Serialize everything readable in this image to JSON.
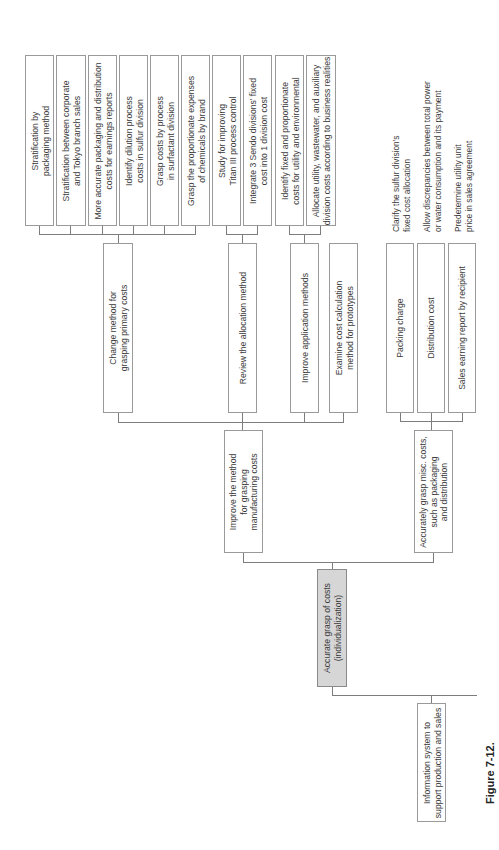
{
  "figure_label": "Figure 7-12.",
  "root": {
    "label_lines": [
      "Accurate grasp of costs",
      "(individualization)"
    ]
  },
  "level1": [
    {
      "label_lines": [
        "Improve the method",
        "for grasping",
        "manufacturing costs"
      ]
    },
    {
      "label_lines": [
        "Accurately grasp misc. costs,",
        "such as packaging",
        "and distribution"
      ]
    }
  ],
  "level2_left": [
    {
      "label_lines": [
        "Change method for",
        "grasping primary costs"
      ]
    },
    {
      "label_lines": [
        "Review the allocation method"
      ]
    },
    {
      "label_lines": [
        "Improve application methods"
      ]
    },
    {
      "label_lines": [
        "Examine cost calculation",
        "method for prototypes"
      ]
    }
  ],
  "level2_right": [
    {
      "label_lines": [
        "Packing charge"
      ]
    },
    {
      "label_lines": [
        "Distribution cost"
      ]
    },
    {
      "label_lines": [
        "Sales earning report by recipient"
      ]
    }
  ],
  "level3": [
    {
      "label_lines": [
        "Stratification by",
        "packaging method"
      ]
    },
    {
      "label_lines": [
        "Stratification between corporate",
        "and Tokyo branch sales"
      ]
    },
    {
      "label_lines": [
        "More accurate packaging and distribution",
        "costs for earnings reports"
      ]
    },
    {
      "label_lines": [
        "Identify dilution process",
        "costs in sulfur division"
      ]
    },
    {
      "label_lines": [
        "Grasp costs by process",
        "in surfactant division"
      ]
    },
    {
      "label_lines": [
        "Grasp the proportionate expenses",
        "of chemicals by brand"
      ]
    },
    {
      "label_lines": [
        "Study for improving",
        "Titan III process control"
      ]
    },
    {
      "label_lines": [
        "Integrate 3 Sendo divisions' fixed",
        "cost into 1 division cost"
      ]
    },
    {
      "label_lines": [
        "Identify fixed and proportionate",
        "costs for utility and environmental"
      ]
    },
    {
      "label_lines": [
        "Allocate utility, wastewater, and auxiliary",
        "division costs according to business realities"
      ]
    }
  ],
  "notes": [
    {
      "label_lines": [
        "Clarify the sulfur division's",
        "fixed cost allocation"
      ]
    },
    {
      "label_lines": [
        "Allow discrepancies between total power",
        "or water consumption and its payment"
      ]
    },
    {
      "label_lines": [
        "Predetermine utility unit",
        "price in sales agreement"
      ]
    }
  ],
  "sibling": {
    "label_lines": [
      "Information system to",
      "support production and sales"
    ]
  },
  "colors": {
    "box_border": "#9a9a9a",
    "root_fill": "#d6d6d6",
    "connector": "#7d7d7d",
    "text": "#3a3a3a"
  }
}
